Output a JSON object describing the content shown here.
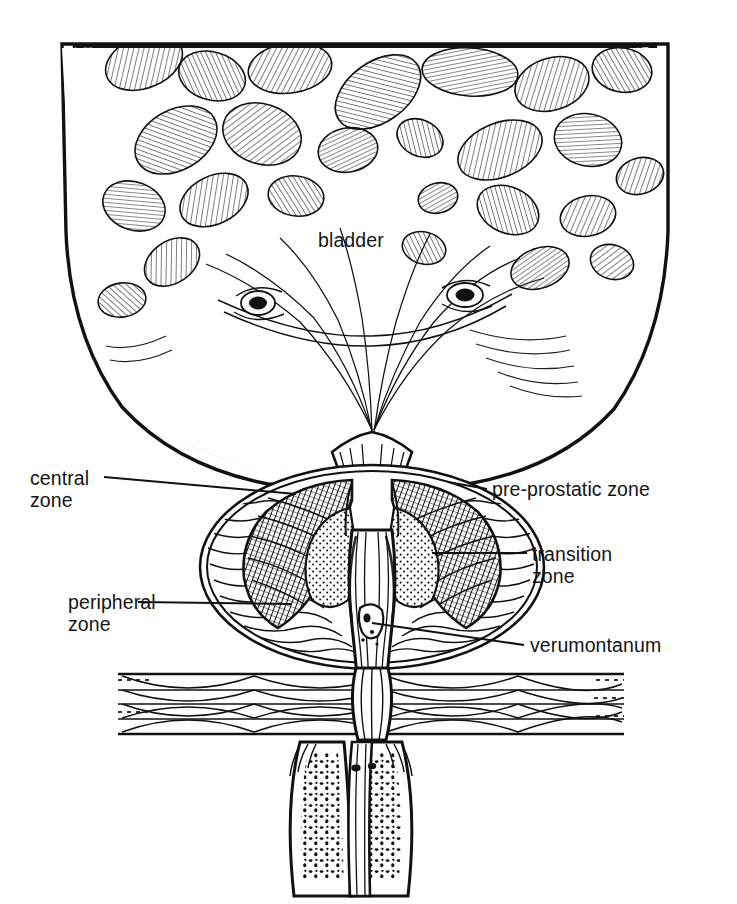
{
  "figure": {
    "type": "medical-line-illustration",
    "style": "black and white pen-and-ink hatching",
    "background_color": "#ffffff",
    "ink_color": "#111111",
    "canvas": {
      "width": 737,
      "height": 904
    }
  },
  "labels": {
    "bladder": {
      "text": "bladder",
      "x": 318,
      "y": 229,
      "side": "center"
    },
    "central_zone": {
      "text": "central\nzone",
      "x": 30,
      "y": 467,
      "side": "left"
    },
    "peripheral_zone": {
      "text": "peripheral\nzone",
      "x": 68,
      "y": 591,
      "side": "left"
    },
    "pre_prostatic": {
      "text": "pre-prostatic zone",
      "x": 492,
      "y": 478,
      "side": "right"
    },
    "transition_zone": {
      "text": "transition\nzone",
      "x": 532,
      "y": 543,
      "side": "right"
    },
    "verumontanum": {
      "text": "verumontanum",
      "x": 530,
      "y": 634,
      "side": "right"
    }
  },
  "leaders": [
    {
      "name": "central-zone-leader",
      "x1": 104,
      "y1": 477,
      "x2": 296,
      "y2": 494
    },
    {
      "name": "peripheral-zone-leader",
      "x1": 138,
      "y1": 602,
      "x2": 292,
      "y2": 604
    },
    {
      "name": "pre-prostatic-leader",
      "x1": 487,
      "y1": 489,
      "x2": 448,
      "y2": 482
    },
    {
      "name": "transition-zone-leader",
      "x1": 527,
      "y1": 553,
      "x2": 432,
      "y2": 553
    },
    {
      "name": "verumontanum-leader",
      "x1": 524,
      "y1": 645,
      "x2": 372,
      "y2": 623
    }
  ],
  "structures": [
    {
      "name": "bladder-lumen",
      "description": "trabeculated bladder interior with hatched mucosal cell islands"
    },
    {
      "name": "bladder-wall",
      "description": "hypertrophied detrusor muscle bundles drawn as dark irregular polygons"
    },
    {
      "name": "ureteral-orifice-left",
      "x": 258,
      "y": 303
    },
    {
      "name": "ureteral-orifice-right",
      "x": 465,
      "y": 295
    },
    {
      "name": "trigone",
      "description": "smooth triangular region funnelling to bladder neck"
    },
    {
      "name": "bladder-neck",
      "x": 372,
      "y": 450
    },
    {
      "name": "prostate-capsule",
      "description": "oval outline surrounding prostatic zones"
    },
    {
      "name": "central-zone",
      "description": "dark cross-hatched wedge flanking the urethra superiorly"
    },
    {
      "name": "transition-zone",
      "description": "stippled paired lobes lateral to proximal urethra"
    },
    {
      "name": "peripheral-zone",
      "description": "wavy-line glandular tissue forming posterior and lateral bulk"
    },
    {
      "name": "pre-prostatic-zone",
      "description": "sphincteric sleeve at the proximal urethra"
    },
    {
      "name": "prostatic-urethra",
      "description": "vertical channel through prostate"
    },
    {
      "name": "verumontanum",
      "x": 366,
      "y": 624
    },
    {
      "name": "urogenital-diaphragm",
      "description": "interlacing horizontal striated muscle fibres"
    },
    {
      "name": "corpus-spongiosum",
      "description": "speckled cavernous erectile tissue below diaphragm"
    },
    {
      "name": "membranous-urethra",
      "description": "urethral continuation through the diaphragm"
    }
  ],
  "caption": {
    "text": ""
  }
}
